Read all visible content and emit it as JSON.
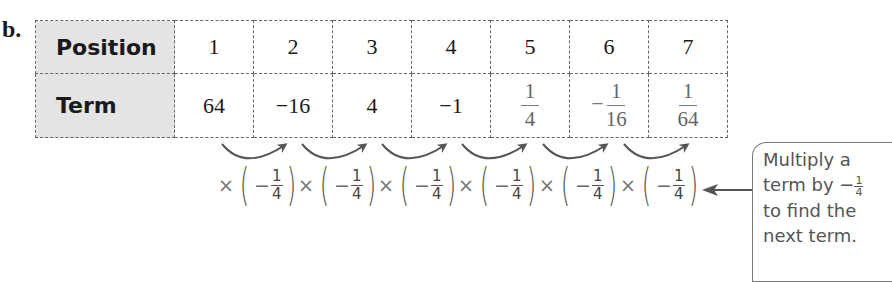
{
  "part_label": "b.",
  "table": {
    "row_headers": [
      "Position",
      "Term"
    ],
    "positions": [
      "1",
      "2",
      "3",
      "4",
      "5",
      "6",
      "7"
    ],
    "terms": [
      {
        "type": "int",
        "text": "64"
      },
      {
        "type": "int",
        "text": "−16"
      },
      {
        "type": "int",
        "text": "4"
      },
      {
        "type": "int",
        "text": "−1"
      },
      {
        "type": "frac",
        "sign": "",
        "num": "1",
        "den": "4"
      },
      {
        "type": "frac",
        "sign": "−",
        "num": "1",
        "den": "16"
      },
      {
        "type": "frac",
        "sign": "",
        "num": "1",
        "den": "64"
      }
    ]
  },
  "multipliers": [
    {
      "times": "×",
      "open": "(",
      "sign": "−",
      "num": "1",
      "den": "4",
      "close": ")"
    },
    {
      "times": "×",
      "open": "(",
      "sign": "−",
      "num": "1",
      "den": "4",
      "close": ")"
    },
    {
      "times": "×",
      "open": "(",
      "sign": "−",
      "num": "1",
      "den": "4",
      "close": ")"
    },
    {
      "times": "×",
      "open": "(",
      "sign": "−",
      "num": "1",
      "den": "4",
      "close": ")"
    },
    {
      "times": "×",
      "open": "(",
      "sign": "−",
      "num": "1",
      "den": "4",
      "close": ")"
    },
    {
      "times": "×",
      "open": "(",
      "sign": "−",
      "num": "1",
      "den": "4",
      "close": ")"
    }
  ],
  "callout": {
    "line1": "Multiply a",
    "line2_prefix": "term by ",
    "line2_sign": "−",
    "line2_num": "1",
    "line2_den": "4",
    "line3": "to find the",
    "line4": "next term."
  }
}
